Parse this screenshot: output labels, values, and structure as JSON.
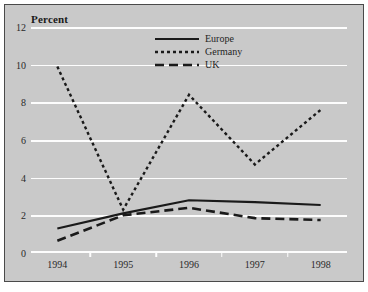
{
  "chart_data": {
    "type": "line",
    "title": "Percent",
    "xlabel": "",
    "ylabel": "Percent",
    "x": [
      1994,
      1995,
      1996,
      1997,
      1998
    ],
    "categories": [
      "1994",
      "1995",
      "1996",
      "1997",
      "1998"
    ],
    "series": [
      {
        "name": "Europe",
        "style": "solid",
        "values": [
          1.3,
          2.1,
          2.8,
          2.7,
          2.55
        ]
      },
      {
        "name": "Germany",
        "style": "dotted",
        "values": [
          9.9,
          2.3,
          8.4,
          4.7,
          7.6
        ]
      },
      {
        "name": "UK",
        "style": "dashed",
        "values": [
          0.65,
          2.0,
          2.4,
          1.85,
          1.75
        ]
      }
    ],
    "ylim": [
      0,
      12
    ],
    "xlim": [
      1993.6,
      1998.4
    ],
    "yticks": [
      0,
      2,
      4,
      6,
      8,
      10,
      12
    ],
    "ytick_labels": [
      "0",
      "2",
      "4",
      "6",
      "8",
      "10",
      "12"
    ],
    "xtick_labels": [
      "1994",
      "1995",
      "1996",
      "1997",
      "1998"
    ],
    "x_minor_ticks": [
      1994.5,
      1995.5,
      1996.5,
      1997.5
    ],
    "grid": "horizontal",
    "grid_color": "#fdfdfd",
    "plot_background": "#c9c9c9",
    "line_color": "#1a1a1a",
    "legend_position": "top-center"
  },
  "legend": {
    "entries": [
      {
        "label": "Europe",
        "style": "solid"
      },
      {
        "label": "Germany",
        "style": "dotted"
      },
      {
        "label": "UK",
        "style": "dashed"
      }
    ]
  },
  "axis": {
    "y_title": "Percent"
  }
}
